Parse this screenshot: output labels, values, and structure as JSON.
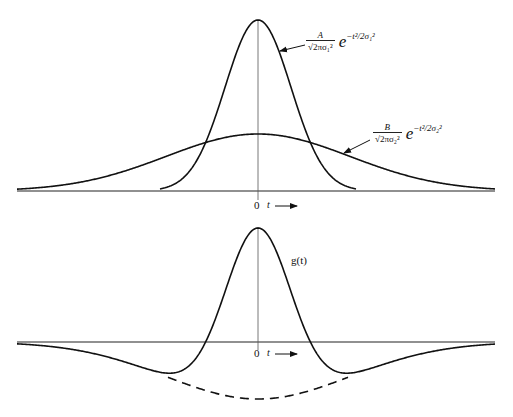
{
  "figure": {
    "top_plot": {
      "curve_a_label": {
        "numerator": "A",
        "denominator": "√2πσ₁²",
        "exponent_base": "e",
        "exponent": "−t²/2σ₁²"
      },
      "curve_b_label": {
        "numerator": "B",
        "denominator": "√2πσ₂²",
        "exponent_base": "e",
        "exponent": "−t²/2σ₂²"
      },
      "origin_label": "0",
      "axis_label": "t"
    },
    "bottom_plot": {
      "curve_label": "g(t)",
      "origin_label": "0",
      "axis_label": "t"
    }
  },
  "colors": {
    "ink": "#111111",
    "background": "#ffffff"
  }
}
